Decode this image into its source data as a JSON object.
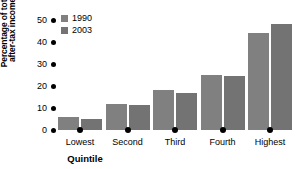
{
  "chart_data": {
    "type": "bar",
    "title": "",
    "xlabel": "Quintile",
    "ylabel": "Percentage of total after-tax income",
    "ylabel_line1": "Percentage of total",
    "ylabel_line2": "after-tax income",
    "categories": [
      "Lowest",
      "Second",
      "Third",
      "Fourth",
      "Highest"
    ],
    "series": [
      {
        "name": "1990",
        "color": "#808080",
        "values": [
          6,
          12,
          18,
          25,
          44
        ]
      },
      {
        "name": "2003",
        "color": "#737373",
        "values": [
          5,
          11.5,
          17,
          24.5,
          48
        ]
      }
    ],
    "ylim": [
      0,
      50
    ],
    "yticks": [
      50,
      40,
      30,
      20,
      10,
      0
    ],
    "grid": false,
    "legend_position": "top-left"
  }
}
